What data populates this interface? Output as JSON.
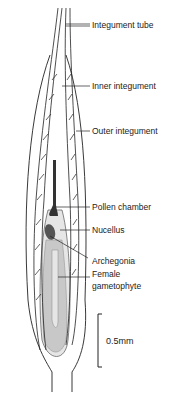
{
  "diagram": {
    "labels": [
      {
        "text": "Integument tube",
        "x": 92,
        "y": 20
      },
      {
        "text": "Inner integument",
        "x": 92,
        "y": 82
      },
      {
        "text": "Outer integument",
        "x": 92,
        "y": 127
      },
      {
        "text": "Pollen chamber",
        "x": 92,
        "y": 203
      },
      {
        "text": "Nucellus",
        "x": 92,
        "y": 226
      },
      {
        "text": "Archegonia",
        "x": 92,
        "y": 258
      },
      {
        "text": "Female",
        "x": 92,
        "y": 271
      },
      {
        "text": "gametophyte",
        "x": 92,
        "y": 283
      }
    ],
    "scale_bar": {
      "label": "0.5mm"
    },
    "colors": {
      "line": "#222222",
      "fill_gametophyte": "#c8c8c8",
      "fill_nucellus": "#e4e4e4"
    }
  }
}
